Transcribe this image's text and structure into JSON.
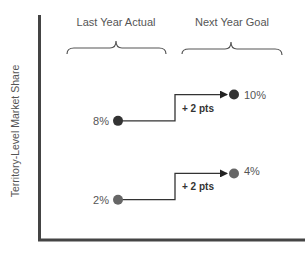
{
  "chart_data": {
    "type": "line",
    "title": "",
    "ylabel": "Territory-Level Market Share",
    "xlabel": "",
    "grid": false,
    "ylim": [
      0,
      14
    ],
    "categories": [
      "Last Year Actual",
      "Next Year Goal"
    ],
    "series": [
      {
        "name": "Upper territory",
        "values": [
          8,
          10
        ],
        "labels": [
          "8%",
          "10%"
        ],
        "delta_label": "+ 2 pts",
        "color": "#333333"
      },
      {
        "name": "Lower territory",
        "values": [
          2,
          4
        ],
        "labels": [
          "2%",
          "4%"
        ],
        "delta_label": "+ 2 pts",
        "color": "#666666"
      }
    ],
    "colors": {
      "axis": "#444444",
      "connector": "#333333",
      "brace": "#555555"
    }
  }
}
